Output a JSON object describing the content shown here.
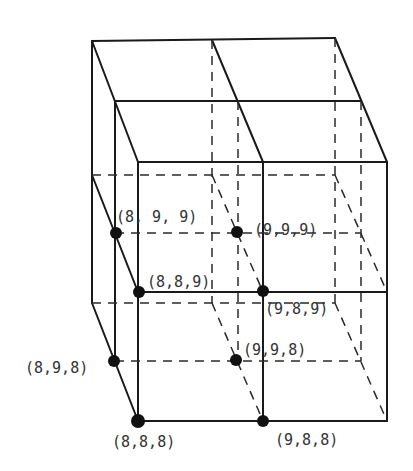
{
  "diagram": {
    "title": "",
    "points": [
      {
        "label": "(8, 9, 9)",
        "x": 116,
        "y": 233,
        "lx": 116,
        "ly": 222
      },
      {
        "label": "(9,9,9)",
        "x": 237,
        "y": 232,
        "lx": 254,
        "ly": 235
      },
      {
        "label": "(8,8,9)",
        "x": 139,
        "y": 292,
        "lx": 147,
        "ly": 287
      },
      {
        "label": "(9,8,9)",
        "x": 263,
        "y": 291,
        "lx": 265,
        "ly": 314
      },
      {
        "label": "(8,9,8)",
        "x": 114,
        "y": 361,
        "lx": 25,
        "ly": 373
      },
      {
        "label": "(9,9,8)",
        "x": 236,
        "y": 360,
        "lx": 243,
        "ly": 355
      },
      {
        "label": "(8,8,8)",
        "x": 138,
        "y": 421,
        "lx": 112,
        "ly": 447
      },
      {
        "label": "(9,8,8)",
        "x": 263,
        "y": 421,
        "lx": 275,
        "ly": 445
      }
    ],
    "colors": {
      "line": "#1a1a1a",
      "dot": "#111111",
      "text": "#333333",
      "background": "#ffffff"
    }
  }
}
